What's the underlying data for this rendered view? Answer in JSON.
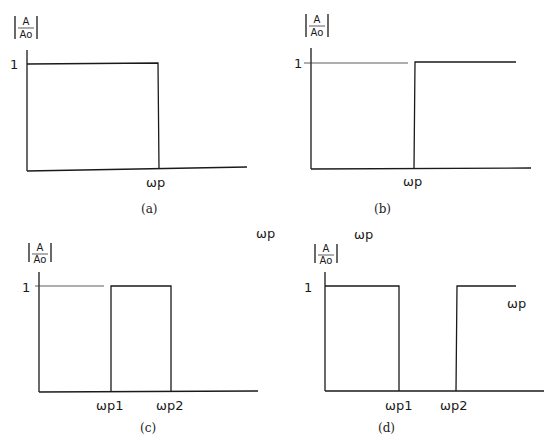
{
  "figure": {
    "ylabel_num": "A",
    "ylabel_den": "Ao",
    "panels": [
      {
        "id": "a",
        "caption": "(a)",
        "y_tick": "1",
        "x_labels": [
          "ωp"
        ],
        "type": "low-pass"
      },
      {
        "id": "b",
        "caption": "(b)",
        "y_tick": "1",
        "x_labels": [
          "ωp"
        ],
        "type": "high-pass"
      },
      {
        "id": "c",
        "caption": "(c)",
        "y_tick": "1",
        "x_labels": [
          "ωp1",
          "ωp2"
        ],
        "type": "band-pass"
      },
      {
        "id": "d",
        "caption": "(d)",
        "y_tick": "1",
        "x_labels": [
          "ωp1",
          "ωp2"
        ],
        "type": "band-stop"
      }
    ],
    "stray_labels": [
      "ωp",
      "ωp",
      "ωp"
    ]
  }
}
